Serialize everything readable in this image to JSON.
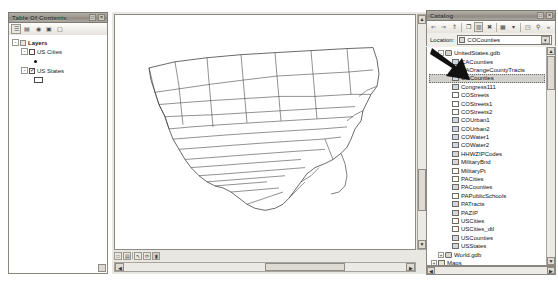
{
  "toc": {
    "title": "Table Of Contents",
    "toolbar": [
      {
        "name": "list-by-drawing-order-button",
        "glyph": "☰"
      },
      {
        "name": "list-by-source-button",
        "glyph": "▤"
      },
      {
        "name": "list-by-visibility-button",
        "glyph": "◉"
      },
      {
        "name": "list-by-selection-button",
        "glyph": "▣"
      },
      {
        "name": "options-button",
        "glyph": "▢"
      }
    ],
    "tree": [
      {
        "label": "Layers",
        "bold": true,
        "indent": 0,
        "expander": "-",
        "checkbox": null,
        "symbol": null
      },
      {
        "label": "US Cities",
        "bold": false,
        "indent": 1,
        "expander": "-",
        "checkbox": "off",
        "symbol": "point"
      },
      {
        "label": "US States",
        "bold": false,
        "indent": 1,
        "expander": "-",
        "checkbox": "on",
        "symbol": "polygon"
      }
    ]
  },
  "map": {
    "view_toolbar": [
      {
        "name": "data-view-button",
        "glyph": "□"
      },
      {
        "name": "layout-view-button",
        "glyph": "▤"
      },
      {
        "name": "zoom-page-button",
        "glyph": "↖"
      },
      {
        "name": "refresh-view-button",
        "glyph": "⟳"
      },
      {
        "name": "pause-drawing-button",
        "glyph": "▮"
      }
    ],
    "scrollbars": {
      "vertical_name": "map-vertical-scrollbar",
      "horizontal_name": "map-horizontal-scrollbar"
    },
    "layer_description": "United States contiguous 48 states boundaries"
  },
  "catalog": {
    "title": "Catalog",
    "window_buttons": [
      {
        "name": "auto-hide-button",
        "glyph": "□"
      },
      {
        "name": "close-button",
        "glyph": "×"
      }
    ],
    "toolbar": [
      {
        "name": "back-button",
        "glyph": "⇐"
      },
      {
        "name": "forward-button",
        "glyph": "⇒"
      },
      {
        "name": "up-one-level-button",
        "glyph": "⇑"
      },
      {
        "name": "copy-button",
        "glyph": "❐"
      },
      {
        "name": "paste-button",
        "glyph": "▥"
      },
      {
        "name": "delete-button",
        "glyph": "✖"
      },
      {
        "name": "contents-view-button",
        "glyph": "▦"
      },
      {
        "name": "view-dropdown-button",
        "glyph": "▾"
      },
      {
        "name": "connect-folder-button",
        "glyph": "◳"
      },
      {
        "name": "search-button",
        "glyph": "⚲"
      },
      {
        "name": "toolbar-overflow-button",
        "glyph": "»"
      }
    ],
    "location": {
      "label": "Location:",
      "value": "COCounties",
      "dropdown_glyph": "▾"
    },
    "tree": [
      {
        "label": "UnitedStates.gdb",
        "indent": 1,
        "expander": "-",
        "icon": "gdb",
        "selected": false
      },
      {
        "label": "CACounties",
        "indent": 2,
        "expander": null,
        "icon": "poly",
        "selected": false
      },
      {
        "label": "CAOrangeCountyTracts",
        "indent": 2,
        "expander": null,
        "icon": "poly",
        "selected": false
      },
      {
        "label": "COCounties",
        "indent": 2,
        "expander": null,
        "icon": "poly",
        "selected": true
      },
      {
        "label": "Congress111",
        "indent": 2,
        "expander": null,
        "icon": "poly",
        "selected": false
      },
      {
        "label": "COStreets",
        "indent": 2,
        "expander": null,
        "icon": "line",
        "selected": false
      },
      {
        "label": "COStreets1",
        "indent": 2,
        "expander": null,
        "icon": "line",
        "selected": false
      },
      {
        "label": "COStreets2",
        "indent": 2,
        "expander": null,
        "icon": "line",
        "selected": false
      },
      {
        "label": "COUrban1",
        "indent": 2,
        "expander": null,
        "icon": "poly",
        "selected": false
      },
      {
        "label": "COUrban2",
        "indent": 2,
        "expander": null,
        "icon": "poly",
        "selected": false
      },
      {
        "label": "COWater1",
        "indent": 2,
        "expander": null,
        "icon": "poly",
        "selected": false
      },
      {
        "label": "COWater2",
        "indent": 2,
        "expander": null,
        "icon": "poly",
        "selected": false
      },
      {
        "label": "HHWZIPCodes",
        "indent": 2,
        "expander": null,
        "icon": "poly",
        "selected": false
      },
      {
        "label": "MilitaryBnd",
        "indent": 2,
        "expander": null,
        "icon": "poly",
        "selected": false
      },
      {
        "label": "MilitaryPt",
        "indent": 2,
        "expander": null,
        "icon": "point",
        "selected": false
      },
      {
        "label": "PACities",
        "indent": 2,
        "expander": null,
        "icon": "point",
        "selected": false
      },
      {
        "label": "PACounties",
        "indent": 2,
        "expander": null,
        "icon": "poly",
        "selected": false
      },
      {
        "label": "PAPublicSchools",
        "indent": 2,
        "expander": null,
        "icon": "point",
        "selected": false
      },
      {
        "label": "PATracts",
        "indent": 2,
        "expander": null,
        "icon": "poly",
        "selected": false
      },
      {
        "label": "PAZIP",
        "indent": 2,
        "expander": null,
        "icon": "poly",
        "selected": false
      },
      {
        "label": "USCities",
        "indent": 2,
        "expander": null,
        "icon": "point",
        "selected": false
      },
      {
        "label": "USCities_dtl",
        "indent": 2,
        "expander": null,
        "icon": "point",
        "selected": false
      },
      {
        "label": "USCounties",
        "indent": 2,
        "expander": null,
        "icon": "poly",
        "selected": false
      },
      {
        "label": "USStates",
        "indent": 2,
        "expander": null,
        "icon": "poly",
        "selected": false
      },
      {
        "label": "World.gdb",
        "indent": 1,
        "expander": "+",
        "icon": "gdb",
        "selected": false
      },
      {
        "label": "Maps",
        "indent": 0,
        "expander": "+",
        "icon": "fold",
        "selected": false
      },
      {
        "label": "MyAssignments",
        "indent": 0,
        "expander": "+",
        "icon": "fold",
        "selected": false
      },
      {
        "label": "MyExercises",
        "indent": 0,
        "expander": "+",
        "icon": "fold",
        "selected": false
      }
    ]
  },
  "annotation": {
    "name": "pointer-arrow-annotation",
    "points_to": "COCounties"
  },
  "colors": {
    "panel": "#f1efe9",
    "titlebar": "#9c9890",
    "selection": "#d2d0ca",
    "border": "#8a8780"
  }
}
